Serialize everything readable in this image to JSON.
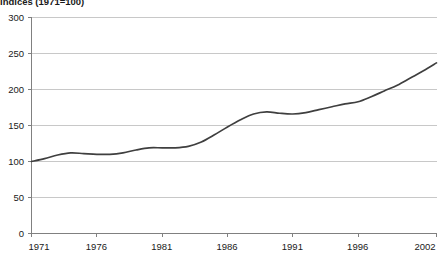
{
  "chart_data": {
    "type": "line",
    "title": "Indices (1971=100)",
    "xlabel": "",
    "ylabel": "",
    "xlim": [
      1971,
      2002
    ],
    "ylim": [
      0,
      300
    ],
    "grid": true,
    "legend": false,
    "yticks": [
      0,
      50,
      100,
      150,
      200,
      250,
      300
    ],
    "ytick_labels": [
      "0",
      "50",
      "100",
      "150",
      "200",
      "250",
      "300"
    ],
    "xticks": [
      1971,
      1976,
      1981,
      1986,
      1991,
      1996,
      2002
    ],
    "xtick_labels": [
      "1971",
      "1976",
      "1981",
      "1986",
      "1991",
      "1996",
      "2002"
    ],
    "line_color": "#3f3f3f",
    "grid_color": "#c8c8c8",
    "axis_color": "#808080",
    "series": [
      {
        "name": "Index",
        "x": [
          1971,
          1972,
          1973,
          1974,
          1975,
          1976,
          1977,
          1978,
          1979,
          1980,
          1981,
          1982,
          1983,
          1984,
          1985,
          1986,
          1987,
          1988,
          1989,
          1990,
          1991,
          1992,
          1993,
          1994,
          1995,
          1996,
          1997,
          1998,
          1999,
          2000,
          2001,
          2002
        ],
        "values": [
          100,
          104,
          109,
          112,
          111,
          110,
          110,
          112,
          116,
          119,
          119,
          119,
          121,
          127,
          137,
          148,
          158,
          166,
          169,
          167,
          166,
          168,
          172,
          176,
          180,
          183,
          190,
          198,
          206,
          216,
          226,
          237
        ]
      }
    ]
  }
}
